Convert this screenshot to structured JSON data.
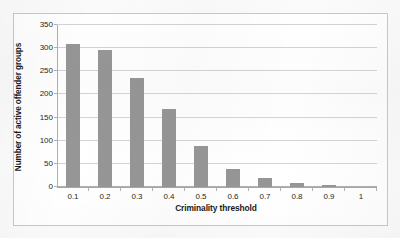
{
  "chart_data": {
    "type": "bar",
    "title": "",
    "subtitle": "",
    "xlabel": "Criminality threshold",
    "ylabel": "Number of active offender groups",
    "categories": [
      "0.1",
      "0.2",
      "0.3",
      "0.4",
      "0.5",
      "0.6",
      "0.7",
      "0.8",
      "0.9",
      "1"
    ],
    "values": [
      310,
      297,
      235,
      168,
      89,
      39,
      19,
      8,
      4,
      0
    ],
    "ylim": [
      0,
      350
    ],
    "ytick_labels": [
      "0",
      "50",
      "100",
      "150",
      "200",
      "250",
      "300",
      "350"
    ],
    "ytick_values": [
      0,
      50,
      100,
      150,
      200,
      250,
      300,
      350
    ],
    "grid": true,
    "legend": false,
    "legend_position": "none",
    "series": [
      {
        "name": "Number of active offender groups",
        "values": [
          310,
          297,
          235,
          168,
          89,
          39,
          19,
          8,
          4,
          0
        ]
      }
    ],
    "colors": {
      "bar": "#969696",
      "gridline": "#d4d4d4",
      "axis": "#b0b0b0",
      "text": "#1a1a1a",
      "plot_background": "#ffffff",
      "figure_border": "#c8c8c8",
      "page_background": "#fbfbfb"
    }
  }
}
